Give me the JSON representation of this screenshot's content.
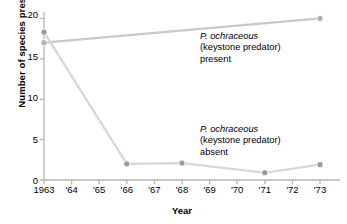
{
  "chart_data": {
    "type": "line",
    "title": "",
    "xlabel": "Year",
    "ylabel": "Number of species present",
    "x": [
      1963,
      1964,
      1965,
      1966,
      1967,
      1968,
      1969,
      1970,
      1971,
      1972,
      1973
    ],
    "xtick_labels": [
      "1963",
      "'64",
      "'65",
      "'66",
      "'67",
      "'68",
      "'69",
      "'70",
      "'71",
      "'72",
      "'73"
    ],
    "ytick_labels": [
      "0",
      "5",
      "10",
      "15",
      "20"
    ],
    "ytick_values": [
      0,
      5,
      10,
      15,
      20
    ],
    "ylim": [
      0,
      20.8
    ],
    "xlim": [
      1963,
      1973
    ],
    "grid": false,
    "legend": "annotations on plot",
    "series": [
      {
        "name": "P. ochraceous (keystone predator) present",
        "color": "#c9c9c9",
        "marker_color": "#b0b0b0",
        "points": [
          {
            "x": 1963,
            "y": 17.0
          },
          {
            "x": 1973,
            "y": 20.0
          }
        ]
      },
      {
        "name": "P. ochraceous (keystone predator) absent",
        "color": "#d6d6d6",
        "marker_color": "#9a9a9a",
        "points": [
          {
            "x": 1963,
            "y": 18.3
          },
          {
            "x": 1966,
            "y": 2.0
          },
          {
            "x": 1968,
            "y": 2.1
          },
          {
            "x": 1971,
            "y": 0.9
          },
          {
            "x": 1973,
            "y": 1.9
          }
        ]
      }
    ],
    "annotations": [
      {
        "id": "present",
        "species": "P. ochraceous",
        "qualifier": "(keystone predator)",
        "state": "present"
      },
      {
        "id": "absent",
        "species": "P. ochraceous",
        "qualifier": "(keystone predator)",
        "state": "absent"
      }
    ]
  },
  "axis": {
    "color": "#b5b5b5",
    "tick_color": "#b5b5b5"
  }
}
